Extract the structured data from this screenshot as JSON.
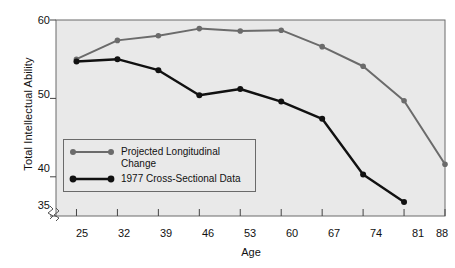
{
  "chart_data": {
    "type": "line",
    "title": "",
    "xlabel": "Age",
    "ylabel": "Total Intellectual Ability",
    "x": [
      25,
      32,
      39,
      46,
      53,
      60,
      67,
      74,
      81,
      88
    ],
    "xticklabels": [
      "25",
      "32",
      "39",
      "46",
      "53",
      "60",
      "67",
      "74",
      "81",
      "88"
    ],
    "yticks": [
      35,
      40,
      50,
      60
    ],
    "yticklabels": [
      "35",
      "40",
      "50",
      "60"
    ],
    "xlim": [
      21.5,
      88
    ],
    "ylim": [
      35,
      60
    ],
    "grid": false,
    "axis_break": true,
    "legend_position": "lower-left-inside",
    "series": [
      {
        "name": "Projected Longitudinal Change",
        "color": "#6b6b6b",
        "marker": "circle",
        "x": [
          25,
          32,
          39,
          46,
          53,
          60,
          67,
          74,
          81,
          88
        ],
        "values": [
          55.0,
          57.4,
          58.0,
          58.9,
          58.6,
          58.7,
          56.6,
          54.1,
          49.7,
          41.6
        ]
      },
      {
        "name": "1977 Cross-Sectional Data",
        "color": "#111111",
        "marker": "circle",
        "x": [
          25,
          32,
          39,
          46,
          53,
          60,
          67,
          74,
          81
        ],
        "values": [
          54.7,
          55.0,
          53.6,
          50.4,
          51.2,
          49.6,
          47.4,
          40.3,
          36.8
        ]
      }
    ]
  },
  "legend": {
    "entries": [
      {
        "label_line1": "Projected Longitudinal",
        "label_line2": "Change"
      },
      {
        "label_line1": "1977 Cross-Sectional Data",
        "label_line2": ""
      }
    ]
  }
}
